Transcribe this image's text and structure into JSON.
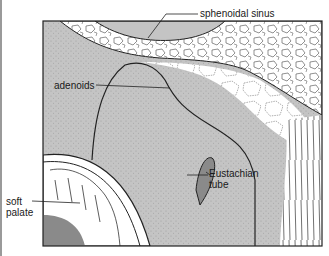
{
  "figure": {
    "type": "anatomical-illustration",
    "colors": {
      "tissue_gray": "#c4c4c4",
      "stipple": "#555555",
      "outline": "#222222",
      "bone_white": "#ffffff"
    },
    "labels": {
      "sphenoidal_sinus": "sphenoidal sinus",
      "adenoids": "adenoids",
      "eustachian_tube_line1": "Eustachian",
      "eustachian_tube_line2": "tube",
      "soft_palate_line1": "soft",
      "soft_palate_line2": "palate"
    }
  }
}
